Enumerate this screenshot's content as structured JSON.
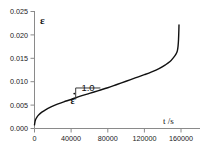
{
  "chart_data": {
    "type": "line",
    "title": "",
    "xlabel": "t /s",
    "ylabel": "ε",
    "xlim": [
      0,
      160000
    ],
    "ylim": [
      0.0,
      0.025
    ],
    "grid": false,
    "legend": "none",
    "xticks": [
      0,
      40000,
      80000,
      120000,
      160000
    ],
    "xtick_labels": [
      "0",
      "40000",
      "80000",
      "120000",
      "160000"
    ],
    "yticks": [
      0.0,
      0.005,
      0.01,
      0.015,
      0.02,
      0.025
    ],
    "ytick_labels": [
      "0.000",
      "0.005",
      "0.010",
      "0.015",
      "0.020",
      "0.025"
    ],
    "series": [
      {
        "name": "creep strain",
        "color": "#111111",
        "x": [
          0,
          1000,
          2500,
          5000,
          8000,
          12000,
          18000,
          25000,
          32000,
          40000,
          50000,
          60000,
          70000,
          80000,
          90000,
          100000,
          110000,
          120000,
          128000,
          136000,
          143000,
          148000,
          152000,
          154500,
          156000,
          156800,
          157300,
          157600,
          157800
        ],
        "y": [
          0.0008,
          0.0018,
          0.0024,
          0.003,
          0.0035,
          0.004,
          0.0046,
          0.0052,
          0.0057,
          0.0062,
          0.0069,
          0.0075,
          0.0081,
          0.0087,
          0.0094,
          0.0101,
          0.0108,
          0.0115,
          0.0121,
          0.0128,
          0.0136,
          0.0143,
          0.0152,
          0.0159,
          0.0166,
          0.0176,
          0.019,
          0.0206,
          0.0221
        ]
      }
    ],
    "annotations": [
      {
        "name": "strain-rate-slope-triangle",
        "rate_symbol": "ε̇",
        "slope_value": "1.0",
        "x_start": 45000,
        "x_end": 72000,
        "y_level": 0.0062
      }
    ]
  },
  "axis": {
    "y_title": "ε",
    "x_title": "t /s"
  },
  "annotation": {
    "rate_symbol": "ε",
    "slope_value": "1.0"
  }
}
